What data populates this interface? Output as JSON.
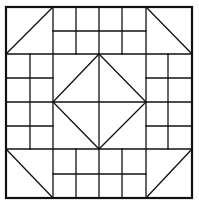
{
  "diagram": {
    "type": "quilt-block-pattern",
    "colors": {
      "line": "#111111",
      "background": "#ffffff"
    },
    "outer_square": {
      "x1": 6,
      "y1": 7,
      "x2": 192,
      "y2": 198
    },
    "regions": {
      "corner_triangles": [
        "top-left",
        "top-right",
        "bottom-left",
        "bottom-right"
      ],
      "edge_grids": [
        {
          "position": "top",
          "cols": 4,
          "rows": 2
        },
        {
          "position": "bottom",
          "cols": 4,
          "rows": 2
        },
        {
          "position": "left",
          "cols": 2,
          "rows": 4
        },
        {
          "position": "right",
          "cols": 2,
          "rows": 4
        }
      ],
      "center": {
        "shape": "diamond-in-square",
        "cross_lines": true
      }
    }
  }
}
